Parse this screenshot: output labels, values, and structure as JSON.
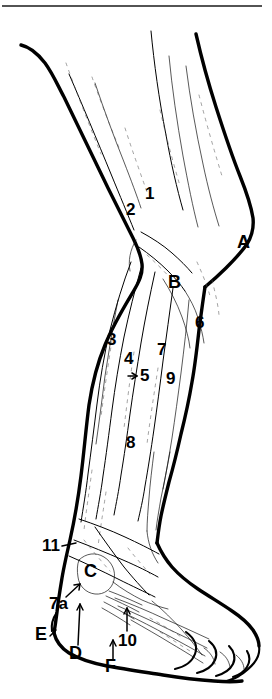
{
  "figure": {
    "top_rule": true,
    "background_color": "#ffffff",
    "ink_color": "#000000"
  },
  "number_labels": [
    {
      "id": "label-1",
      "text": "1",
      "x": 145,
      "y": 199,
      "leader": false
    },
    {
      "id": "label-2",
      "text": "2",
      "x": 126,
      "y": 215,
      "leader": false
    },
    {
      "id": "label-3",
      "text": "3",
      "x": 107,
      "y": 345,
      "leader": false
    },
    {
      "id": "label-4",
      "text": "4",
      "x": 124,
      "y": 364,
      "leader": false
    },
    {
      "id": "label-5",
      "text": "5",
      "x": 140,
      "y": 381,
      "leader": true
    },
    {
      "id": "label-6",
      "text": "6",
      "x": 195,
      "y": 328,
      "leader": false
    },
    {
      "id": "label-7",
      "text": "7",
      "x": 157,
      "y": 355,
      "leader": false
    },
    {
      "id": "label-8",
      "text": "8",
      "x": 126,
      "y": 448,
      "leader": false
    },
    {
      "id": "label-9",
      "text": "9",
      "x": 166,
      "y": 384,
      "leader": false
    },
    {
      "id": "label-10",
      "text": "10",
      "x": 118,
      "y": 646,
      "leader": true
    },
    {
      "id": "label-11",
      "text": "11",
      "x": 42,
      "y": 551,
      "leader": true
    },
    {
      "id": "label-7a",
      "text": "7a",
      "x": 49,
      "y": 609,
      "leader": true
    }
  ],
  "letter_labels": [
    {
      "id": "label-A",
      "text": "A",
      "x": 237,
      "y": 248,
      "leader": false
    },
    {
      "id": "label-B",
      "text": "B",
      "x": 168,
      "y": 288,
      "leader": false
    },
    {
      "id": "label-C",
      "text": "C",
      "x": 84,
      "y": 577,
      "leader": false
    },
    {
      "id": "label-D",
      "text": "D",
      "x": 69,
      "y": 659,
      "leader": true
    },
    {
      "id": "label-E",
      "text": "E",
      "x": 35,
      "y": 640,
      "leader": false
    },
    {
      "id": "label-F",
      "text": "F",
      "x": 105,
      "y": 672,
      "leader": true
    }
  ]
}
